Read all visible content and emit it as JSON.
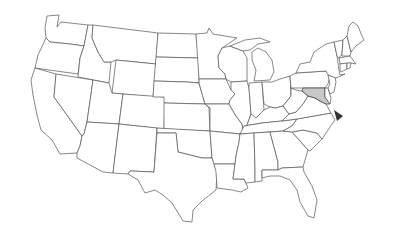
{
  "map": {
    "type": "us-states-outline",
    "highlighted_state": "Maryland",
    "highlight_fill": "#c8c8c8",
    "outline_color": "#555555",
    "pointer": {
      "shape": "triangle",
      "color": "#333333",
      "points_to": "Maryland"
    }
  }
}
